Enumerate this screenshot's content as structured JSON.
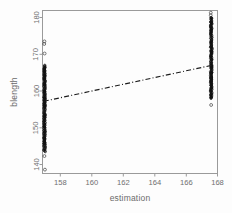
{
  "chart_data": {
    "type": "scatter",
    "title": "",
    "xlabel": "estimation",
    "ylabel": "blength",
    "xlim": [
      156.8,
      168.6
    ],
    "ylim": [
      138,
      182
    ],
    "xticks": [
      158,
      160,
      162,
      164,
      166,
      168
    ],
    "yticks": [
      140,
      150,
      160,
      170,
      180
    ],
    "grid": false,
    "legend": null,
    "series": [
      {
        "name": "observations",
        "marker": "open-circle",
        "description": "Two dense vertical columns of open circles at the two distinct estimation values",
        "groups": [
          {
            "x": 157.0,
            "y_min": 138.6,
            "y_max": 173.5,
            "y_dense_min": 143.5,
            "y_dense_max": 167.0,
            "outliers": [
              138.6,
              142.3,
              144.0,
              144.8,
              173.5,
              172.8,
              170.2
            ],
            "count_estimate": 120
          },
          {
            "x": 167.6,
            "y_min": 156.0,
            "y_max": 181.3,
            "y_dense_min": 158.0,
            "y_dense_max": 180.0,
            "outliers": [
              181.3,
              180.6,
              156.2
            ],
            "count_estimate": 110
          }
        ]
      }
    ],
    "fit_line": {
      "style": "dash-dot",
      "color": "#1c1c1c",
      "x_start": 156.95,
      "y_start": 157.2,
      "x_end": 167.65,
      "y_end": 167.0
    }
  },
  "axes": {
    "x_title": "estimation",
    "y_title": "blength",
    "x_tick_labels": [
      "158",
      "160",
      "162",
      "164",
      "166",
      "168"
    ],
    "y_tick_labels": [
      "140",
      "150",
      "160",
      "170",
      "180"
    ]
  }
}
